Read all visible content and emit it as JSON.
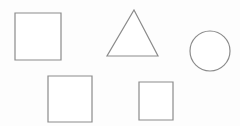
{
  "canvas": {
    "name": "shape-canvas",
    "width": 240,
    "height": 126,
    "background_color": "#fdfdfd",
    "stroke_color": "#8b8b8b",
    "fill_color": "#ffffff",
    "stroke_width": 1.2
  },
  "shapes": [
    {
      "id": "square-large-top-left",
      "type": "square",
      "label": "Square",
      "x": 15,
      "y": 13,
      "width": 46,
      "height": 47,
      "center_x": 38,
      "center_y": 36.5
    },
    {
      "id": "triangle-top-center",
      "type": "triangle",
      "label": "Triangle",
      "apex_x": 134,
      "apex_y": 10,
      "base_left_x": 107,
      "base_right_x": 158,
      "base_y": 56,
      "width": 51,
      "height": 46,
      "points": "134,10 158,56 107,56"
    },
    {
      "id": "circle-top-right",
      "type": "circle",
      "label": "Circle",
      "center_x": 210,
      "center_y": 51,
      "radius": 20,
      "width": 40,
      "height": 40
    },
    {
      "id": "square-bottom-left",
      "type": "square",
      "label": "Square",
      "x": 48,
      "y": 76,
      "width": 44,
      "height": 46,
      "center_x": 70,
      "center_y": 99
    },
    {
      "id": "square-bottom-center",
      "type": "square",
      "label": "Square",
      "x": 139,
      "y": 82,
      "width": 34,
      "height": 38,
      "center_x": 156,
      "center_y": 101
    }
  ]
}
